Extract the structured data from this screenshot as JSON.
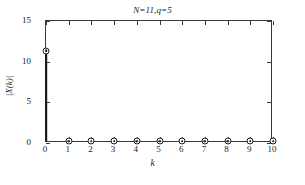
{
  "chart_data": {
    "type": "bar",
    "title": "N=11,q=5",
    "xlabel": "k",
    "ylabel": "|X(k)|",
    "categories": [
      "0",
      "1",
      "2",
      "3",
      "4",
      "5",
      "6",
      "7",
      "8",
      "9",
      "10"
    ],
    "x": [
      0,
      1,
      2,
      3,
      4,
      5,
      6,
      7,
      8,
      9,
      10
    ],
    "values": [
      11.1,
      0,
      0,
      0,
      0,
      0,
      0,
      0,
      0,
      0,
      0
    ],
    "xlim": [
      0,
      10
    ],
    "ylim": [
      0,
      15
    ],
    "xticks": [
      0,
      1,
      2,
      3,
      4,
      5,
      6,
      7,
      8,
      9,
      10
    ],
    "yticks": [
      0,
      5,
      10,
      15
    ],
    "xticklabels": [
      "0",
      "1",
      "2",
      "3",
      "4",
      "5",
      "6",
      "7",
      "8",
      "9",
      "10"
    ],
    "yticklabels": [
      "0",
      "5",
      "10",
      "15"
    ],
    "grid": false,
    "legend": false,
    "marker": "circle-with-dot",
    "series_color": "#1a1a1a",
    "axis_color": "#3a3a3a",
    "background": "#ffffff",
    "annotations": [
      "N=11",
      "q=5"
    ]
  }
}
